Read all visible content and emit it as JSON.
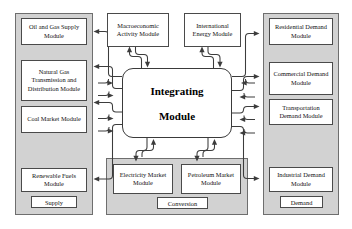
{
  "diagram": {
    "center": {
      "name": "integrating-module",
      "line1": "Integrating",
      "line2": "Module"
    },
    "top_modules": [
      {
        "id": "macroeconomic-activity-module",
        "label": "Macroeconomic Activity Module"
      },
      {
        "id": "international-energy-module",
        "label": "International Energy Module"
      }
    ],
    "groups": [
      {
        "id": "supply-group",
        "caption": "Supply",
        "modules": [
          {
            "id": "oil-and-gas-supply-module",
            "label": "Oil and Gas Supply Module"
          },
          {
            "id": "natural-gas-transmission-and-distribution-module",
            "label": "Natural Gas Transmission and Distribution Module"
          },
          {
            "id": "coal-market-module",
            "label": "Coal Market Module"
          },
          {
            "id": "renewable-fuels-module",
            "label": "Renewable Fuels Module"
          }
        ]
      },
      {
        "id": "conversion-group",
        "caption": "Conversion",
        "modules": [
          {
            "id": "electricity-market-module",
            "label": "Electricity Market Module"
          },
          {
            "id": "petroleum-market-module",
            "label": "Petroleum Market Module"
          }
        ]
      },
      {
        "id": "demand-group",
        "caption": "Demand",
        "modules": [
          {
            "id": "residential-demand-module",
            "label": "Residential Demand Module"
          },
          {
            "id": "commercial-demand-module",
            "label": "Commercial Demand Module"
          },
          {
            "id": "transportation-demand-module",
            "label": "Transportation Demand Module"
          },
          {
            "id": "industrial-demand-module",
            "label": "Industrial Demand Module"
          }
        ]
      }
    ],
    "colors": {
      "panel_fill": "#d2d2d2",
      "panel_stroke": "#6e6e6e",
      "box_fill": "#ffffff",
      "box_stroke": "#4a4a4a",
      "connector": "#3c3c3c",
      "background": "#ffffff"
    }
  }
}
